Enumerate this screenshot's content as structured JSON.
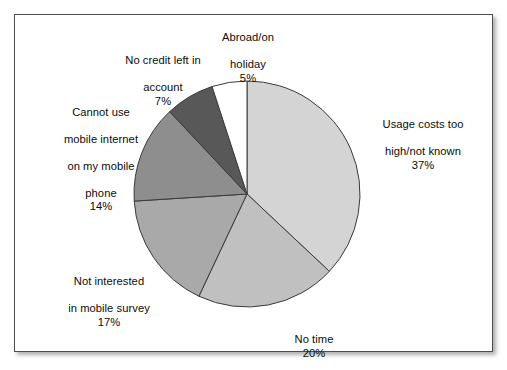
{
  "figure": {
    "frame_border_color": "#4d4d4d",
    "background_color": "#ffffff"
  },
  "chart_data": {
    "type": "pie",
    "title": "",
    "subtitle": "",
    "xlabel": "",
    "ylabel": "",
    "legend_position": "none",
    "grid": false,
    "units": "percent",
    "start_angle_deg": 0,
    "direction": "clockwise",
    "categories": [
      "Usage costs too high/not known",
      "No time",
      "Not interested in mobile survey",
      "Cannot use mobile internet on my mobile phone",
      "No credit left in account",
      "Abroad/on holiday"
    ],
    "values": [
      37,
      20,
      17,
      14,
      7,
      5
    ],
    "colors": [
      "#d4d4d4",
      "#c0c0c0",
      "#a9a9a9",
      "#8e8e8e",
      "#585858",
      "#ffffff"
    ],
    "slice_border_color": "#3a3a3a",
    "slices": [
      {
        "name": "usage-costs",
        "label": "Usage costs too\nhigh/not known",
        "label_line1": "Usage costs too",
        "label_line2": "high/not known",
        "value": 37,
        "percent_text": "37%",
        "color": "#d4d4d4"
      },
      {
        "name": "no-time",
        "label": "No time",
        "label_line1": "No time",
        "label_line2": "",
        "value": 20,
        "percent_text": "20%",
        "color": "#c0c0c0"
      },
      {
        "name": "not-interested",
        "label": "Not interested\nin mobile survey",
        "label_line1": "Not interested",
        "label_line2": "in mobile survey",
        "value": 17,
        "percent_text": "17%",
        "color": "#a9a9a9"
      },
      {
        "name": "cannot-use-mobile-internet",
        "label": "Cannot use\nmobile internet\non my mobile\nphone",
        "label_line1": "Cannot use",
        "label_line2": "mobile internet",
        "label_line3": "on my mobile",
        "label_line4": "phone",
        "value": 14,
        "percent_text": "14%",
        "color": "#8e8e8e"
      },
      {
        "name": "no-credit-left",
        "label": "No credit left in\naccount",
        "label_line1": "No credit left in",
        "label_line2": "account",
        "value": 7,
        "percent_text": "7%",
        "color": "#585858"
      },
      {
        "name": "abroad-on-holiday",
        "label": "Abroad/on\nholiday",
        "label_line1": "Abroad/on",
        "label_line2": "holiday",
        "value": 5,
        "percent_text": "5%",
        "color": "#ffffff"
      }
    ]
  }
}
